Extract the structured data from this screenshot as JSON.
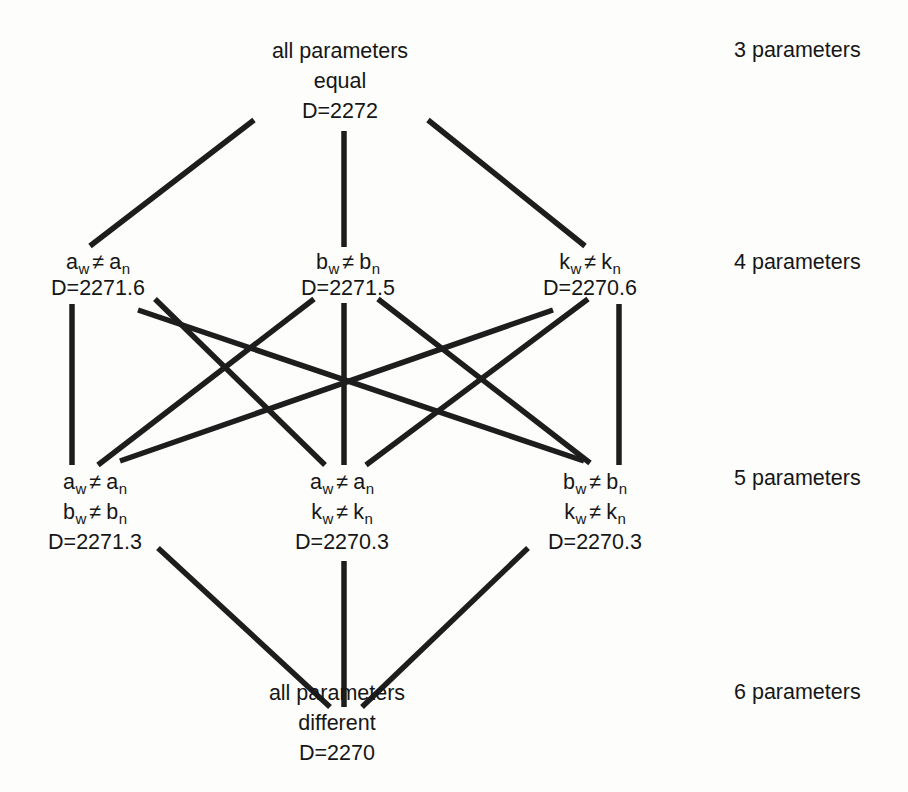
{
  "colors": {
    "background": "#fdfdfc",
    "ink": "#161616",
    "line": "#1d1d1d"
  },
  "nodes": {
    "top": {
      "lines": [
        "all parameters",
        "equal",
        "D=2272"
      ]
    },
    "p4a": {
      "params": [
        {
          "b1": "a",
          "s1": "w",
          "op": "≠",
          "b2": "a",
          "s2": "n"
        }
      ],
      "d": "D=2271.6"
    },
    "p4b": {
      "params": [
        {
          "b1": "b",
          "s1": "w",
          "op": "≠",
          "b2": "b",
          "s2": "n"
        }
      ],
      "d": "D=2271.5"
    },
    "p4k": {
      "params": [
        {
          "b1": "k",
          "s1": "w",
          "op": "≠",
          "b2": "k",
          "s2": "n"
        }
      ],
      "d": "D=2270.6"
    },
    "p5ab": {
      "params": [
        {
          "b1": "a",
          "s1": "w",
          "op": "≠",
          "b2": "a",
          "s2": "n"
        },
        {
          "b1": "b",
          "s1": "w",
          "op": "≠",
          "b2": "b",
          "s2": "n"
        }
      ],
      "d": "D=2271.3"
    },
    "p5ak": {
      "params": [
        {
          "b1": "a",
          "s1": "w",
          "op": "≠",
          "b2": "a",
          "s2": "n"
        },
        {
          "b1": "k",
          "s1": "w",
          "op": "≠",
          "b2": "k",
          "s2": "n"
        }
      ],
      "d": "D=2270.3"
    },
    "p5bk": {
      "params": [
        {
          "b1": "b",
          "s1": "w",
          "op": "≠",
          "b2": "b",
          "s2": "n"
        },
        {
          "b1": "k",
          "s1": "w",
          "op": "≠",
          "b2": "k",
          "s2": "n"
        }
      ],
      "d": "D=2270.3"
    },
    "bottom": {
      "lines": [
        "all parameters",
        "different",
        "D=2270"
      ]
    }
  },
  "side_labels": {
    "row1": "3 parameters",
    "row2": "4 parameters",
    "row3": "5 parameters",
    "row4": "6 parameters"
  },
  "edges": [
    [
      "top",
      "p4a"
    ],
    [
      "top",
      "p4b"
    ],
    [
      "top",
      "p4k"
    ],
    [
      "p4a",
      "p5ab"
    ],
    [
      "p4a",
      "p5ak"
    ],
    [
      "p4a",
      "p5bk"
    ],
    [
      "p4b",
      "p5ab"
    ],
    [
      "p4b",
      "p5ak"
    ],
    [
      "p4b",
      "p5bk"
    ],
    [
      "p4k",
      "p5ab"
    ],
    [
      "p4k",
      "p5ak"
    ],
    [
      "p4k",
      "p5bk"
    ],
    [
      "p5ab",
      "bottom"
    ],
    [
      "p5ak",
      "bottom"
    ],
    [
      "p5bk",
      "bottom"
    ]
  ]
}
